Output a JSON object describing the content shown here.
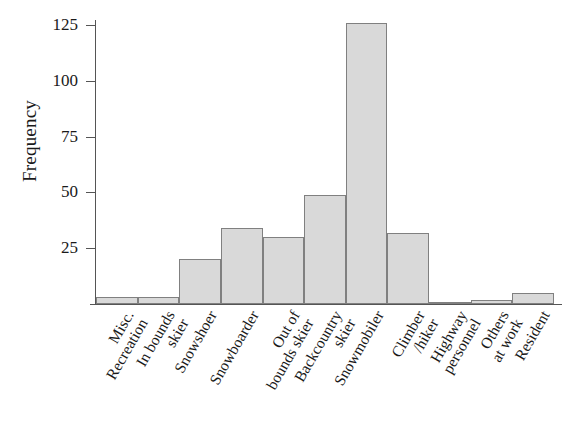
{
  "chart_data": {
    "type": "bar",
    "title": "",
    "xlabel": "",
    "ylabel": "Frequency",
    "ylim": [
      0,
      135
    ],
    "yticks": [
      25,
      50,
      75,
      100,
      125
    ],
    "grid": false,
    "legend": null,
    "bar_color": "#d9d9d9",
    "bar_edge_color": "#808080",
    "axis_color": "#555555",
    "categories": [
      "Misc. Recreation",
      "In bounds skier",
      "Snowshoer",
      "Snowboarder",
      "Out of bounds skier",
      "Backcountry skier",
      "Snowmobiler",
      "Climber /hiker",
      "Highway personnel",
      "Others at work",
      "Resident"
    ],
    "category_lines": [
      [
        "Misc.",
        "Recreation"
      ],
      [
        "In bounds",
        "skier"
      ],
      [
        "Snowshoer"
      ],
      [
        "Snowboarder"
      ],
      [
        "Out of",
        "bounds skier"
      ],
      [
        "Backcountry",
        "skier"
      ],
      [
        "Snowmobiler"
      ],
      [
        "Climber",
        "/hiker"
      ],
      [
        "Highway",
        "personnel"
      ],
      [
        "Others",
        "at work"
      ],
      [
        "Resident"
      ]
    ],
    "values": [
      3,
      3,
      20,
      34,
      30,
      49,
      126,
      32,
      1,
      2,
      5
    ]
  },
  "axis": {
    "y_title": "Frequency",
    "tick_labels": [
      "125",
      "100",
      "75",
      "50",
      "25"
    ]
  }
}
